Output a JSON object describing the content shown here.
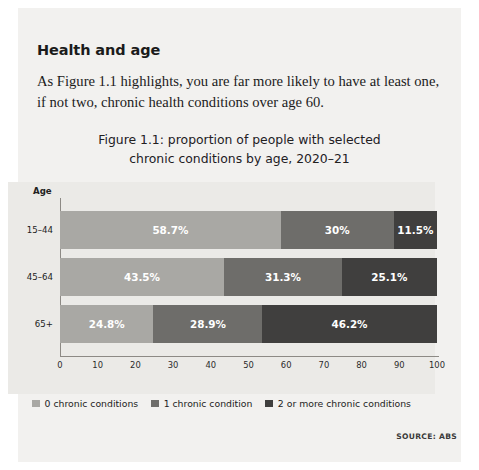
{
  "section": {
    "heading": "Health and age",
    "paragraph": "As Figure 1.1 highlights, you are far more likely to have at least one, if not two, chronic health conditions over age 60."
  },
  "source_note": "SOURCE: ABS",
  "chart_data": {
    "type": "bar",
    "orientation": "horizontal",
    "stacked": true,
    "title": "Figure 1.1: proportion of people with selected chronic conditions by age, 2020–21",
    "title_line1": "Figure 1.1: proportion of people with selected",
    "title_line2": "chronic conditions by age, 2020–21",
    "xlabel": "",
    "ylabel": "Age",
    "categories": [
      "15–44",
      "45–64",
      "65+"
    ],
    "xlim": [
      0,
      100
    ],
    "xticks": [
      0,
      10,
      20,
      30,
      40,
      50,
      60,
      70,
      80,
      90,
      100
    ],
    "grid": false,
    "legend_position": "bottom",
    "series": [
      {
        "name": "0 chronic conditions",
        "color": "#a9a8a4",
        "values": [
          58.7,
          43.5,
          24.8
        ],
        "labels": [
          "58.7%",
          "43.5%",
          "24.8%"
        ]
      },
      {
        "name": "1 chronic condition",
        "color": "#6e6d6a",
        "values": [
          30.0,
          31.3,
          28.9
        ],
        "labels": [
          "30%",
          "31.3%",
          "28.9%"
        ]
      },
      {
        "name": "2 or more chronic conditions",
        "color": "#403f3e",
        "values": [
          11.5,
          25.1,
          46.2
        ],
        "labels": [
          "11.5%",
          "25.1%",
          "46.2%"
        ]
      }
    ]
  }
}
